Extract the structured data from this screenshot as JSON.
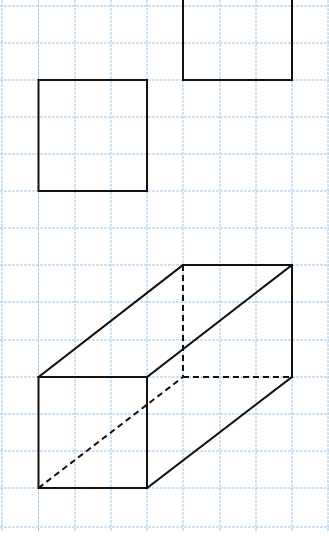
{
  "diagram": {
    "background_color": "#ffffff",
    "grid": {
      "color": "#9fc7ea",
      "x_lines": [
        2,
        38.5,
        75,
        111,
        147,
        183,
        220,
        256,
        292,
        328
      ],
      "y_lines": [
        6,
        43,
        80,
        117,
        154,
        191,
        228,
        265,
        302,
        340,
        377,
        414,
        451,
        488,
        527
      ],
      "x_extent": [
        0,
        329
      ],
      "y_extent": [
        0,
        531
      ]
    },
    "line_color": "#111111",
    "shapes": [
      {
        "name": "square-left",
        "type": "square",
        "x1": 38.5,
        "y1": 80,
        "x2": 147,
        "y2": 191
      },
      {
        "name": "square-top-right",
        "type": "square",
        "x1": 183,
        "y1": -40,
        "x2": 292,
        "y2": 80
      },
      {
        "name": "rectangular-prism",
        "type": "prism",
        "front_face": {
          "x1": 38.5,
          "y1": 377,
          "x2": 147,
          "y2": 488
        },
        "solid_edges": [
          [
            38.5,
            377,
            183,
            265
          ],
          [
            183,
            265,
            292,
            265
          ],
          [
            292,
            265,
            292,
            377
          ],
          [
            147,
            377,
            292,
            265
          ],
          [
            147,
            488,
            292,
            377
          ]
        ],
        "hidden_edges": [
          [
            183,
            265,
            183,
            377
          ],
          [
            183,
            377,
            292,
            377
          ],
          [
            38.5,
            488,
            183,
            377
          ]
        ]
      }
    ]
  }
}
